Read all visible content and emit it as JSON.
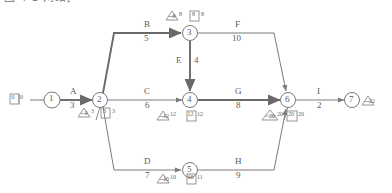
{
  "caption": {
    "text": "图 4-1 网络图及参数"
  },
  "diagram": {
    "type": "pert-network",
    "nodes": [
      {
        "id": "1",
        "label": "1",
        "x": 52,
        "y": 100,
        "es": "0",
        "ef": "0",
        "ls": "",
        "lf": "",
        "show_triangle": false,
        "show_box": true,
        "box_left": "0",
        "box_right": "0",
        "side": "left"
      },
      {
        "id": "2",
        "label": "2",
        "x": 100,
        "y": 100,
        "tri_left": "3",
        "tri_right": "3",
        "box_left": "3",
        "box_right": "3",
        "show_triangle": true,
        "show_box": true,
        "side": "below"
      },
      {
        "id": "3",
        "label": "3",
        "x": 190,
        "y": 33,
        "tri_left": "8",
        "tri_right": "8",
        "box_left": "8",
        "box_right": "8",
        "show_triangle": true,
        "show_box": true,
        "side": "above"
      },
      {
        "id": "4",
        "label": "4",
        "x": 190,
        "y": 100,
        "tri_left": "12",
        "tri_right": "12",
        "box_left": "12",
        "box_right": "12",
        "show_triangle": true,
        "show_box": true,
        "side": "below"
      },
      {
        "id": "5",
        "label": "5",
        "x": 190,
        "y": 170,
        "tri_left": "10",
        "tri_right": "10",
        "box_left": "10",
        "box_right": "11",
        "show_triangle": true,
        "show_box": true,
        "side": "below"
      },
      {
        "id": "6",
        "label": "6",
        "x": 288,
        "y": 100,
        "tri_left": "20",
        "tri_right": "20",
        "box_left": "20",
        "box_right": "20",
        "show_triangle": true,
        "show_box": true,
        "side": "below"
      },
      {
        "id": "7",
        "label": "7",
        "x": 352,
        "y": 100,
        "tri_left": "22",
        "tri_right": "",
        "box_left": "",
        "box_right": "",
        "show_triangle": true,
        "show_box": false,
        "side": "right"
      }
    ],
    "edges": [
      {
        "name": "A",
        "duration": "3",
        "from": "1",
        "to": "2",
        "critical": true,
        "label_x": 72,
        "label_y": 92
      },
      {
        "name": "B",
        "duration": "5",
        "from": "2",
        "to": "3",
        "critical": true,
        "label_x": 147,
        "label_y": 26
      },
      {
        "name": "C",
        "duration": "6",
        "from": "2",
        "to": "4",
        "critical": false,
        "label_x": 147,
        "label_y": 92
      },
      {
        "name": "D",
        "duration": "7",
        "from": "2",
        "to": "5",
        "critical": false,
        "label_x": 147,
        "label_y": 163
      },
      {
        "name": "E",
        "duration": "4",
        "from": "3",
        "to": "4",
        "critical": true,
        "label_x": 178,
        "label_y": 60
      },
      {
        "name": "F",
        "duration": "10",
        "from": "3",
        "to": "6",
        "critical": false,
        "label_x": 237,
        "label_y": 26
      },
      {
        "name": "G",
        "duration": "8",
        "from": "4",
        "to": "6",
        "critical": true,
        "label_x": 237,
        "label_y": 92
      },
      {
        "name": "H",
        "duration": "9",
        "from": "5",
        "to": "6",
        "critical": false,
        "label_x": 237,
        "label_y": 163
      },
      {
        "name": "I",
        "duration": "2",
        "from": "6",
        "to": "7",
        "critical": false,
        "label_x": 318,
        "label_y": 92
      }
    ],
    "colors": {
      "line": "#7a7a7a",
      "critical_line": "#6a6a6a",
      "text": "#5a5a5a",
      "background": "#ffffff"
    }
  }
}
